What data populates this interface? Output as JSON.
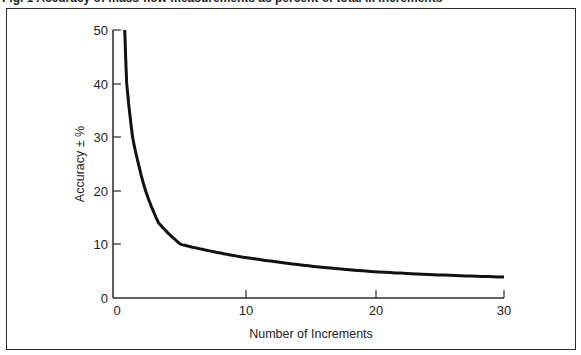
{
  "figure": {
    "title": "Fig. 1 Accuracy of mass-flow measurements as percent of total ... increments"
  },
  "chart_data": {
    "type": "line",
    "xlabel": "Number of Increments",
    "ylabel": "Accuracy ± %",
    "xlim": [
      0,
      30
    ],
    "ylim": [
      0,
      50
    ],
    "x_ticks": [
      0,
      10,
      20,
      30
    ],
    "y_ticks": [
      0,
      10,
      20,
      30,
      40,
      50
    ],
    "grid": false,
    "legend": null,
    "series": [
      {
        "name": "Accuracy",
        "x": [
          0.9,
          1.05,
          1.5,
          2.5,
          3.5,
          5.2,
          7,
          10,
          15,
          20,
          25,
          30
        ],
        "y": [
          50,
          40,
          30,
          20,
          14,
          10,
          9,
          7.6,
          6,
          4.9,
          4.3,
          3.9
        ]
      }
    ]
  },
  "axes": {
    "x_tick_labels": [
      "0",
      "10",
      "20",
      "30"
    ],
    "y_tick_labels": [
      "0",
      "10",
      "20",
      "30",
      "40",
      "50"
    ],
    "x_title": "Number of Increments",
    "y_title": "Accuracy ± %"
  },
  "colors": {
    "line": "#111111",
    "axis": "#2a2a2a",
    "background": "#ffffff"
  }
}
